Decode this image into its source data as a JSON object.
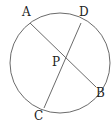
{
  "diagram": {
    "type": "geometry-intersecting-chords",
    "stroke_color": "#6b6b6b",
    "text_color": "#222222",
    "circle": {
      "cx": 60,
      "cy": 63,
      "r": 50
    },
    "points": {
      "A": {
        "x": 30,
        "y": 23,
        "label": "A",
        "lx": 22,
        "ly": 16
      },
      "D": {
        "x": 81,
        "y": 23,
        "label": "D",
        "lx": 79,
        "ly": 16
      },
      "B": {
        "x": 96,
        "y": 87,
        "label": "B",
        "lx": 96,
        "ly": 97
      },
      "C": {
        "x": 44,
        "y": 108,
        "label": "C",
        "lx": 34,
        "ly": 120
      },
      "P": {
        "x": 65,
        "y": 58,
        "label": "P",
        "lx": 52,
        "ly": 66
      }
    },
    "chords": [
      {
        "from": "A",
        "to": "B"
      },
      {
        "from": "D",
        "to": "C"
      }
    ]
  }
}
